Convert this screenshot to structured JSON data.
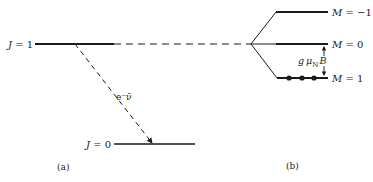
{
  "figure": {
    "panel_a": {
      "caption": "(a)",
      "levels": [
        {
          "label": "J = 1",
          "symbol": "J",
          "value": "1"
        },
        {
          "label": "J = 0",
          "symbol": "J",
          "value": "0"
        }
      ],
      "transition_label": "e⁻ν̄"
    },
    "panel_b": {
      "caption": "(b)",
      "sublevels": [
        {
          "label": "M = −1",
          "symbol": "M",
          "value": "−1"
        },
        {
          "label": "M = 0",
          "symbol": "M",
          "value": "0"
        },
        {
          "label": "M = 1",
          "symbol": "M",
          "value": "1"
        }
      ],
      "splitting_label": {
        "g": "g",
        "mu": "μ",
        "sub": "N",
        "B": "B"
      },
      "population_dots": 3
    },
    "colors": {
      "line": "#1a1a1a",
      "background": "#ffffff"
    }
  }
}
